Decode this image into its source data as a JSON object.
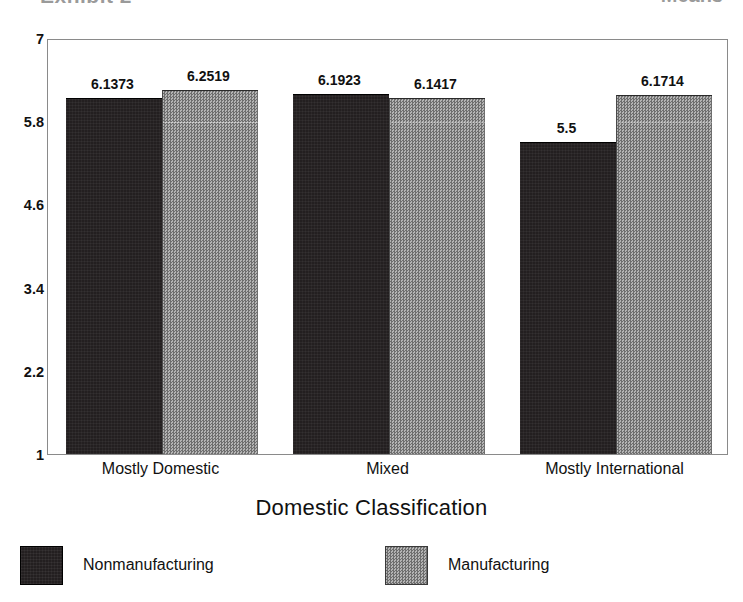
{
  "header": {
    "clipped_title_left": "Exhibit 2",
    "clipped_title_right": "Means"
  },
  "chart_data": {
    "type": "bar",
    "title": "",
    "xlabel": "Domestic Classification",
    "ylabel": "",
    "categories": [
      "Mostly Domestic",
      "Mixed",
      "Mostly International"
    ],
    "series": [
      {
        "name": "Nonmanufacturing",
        "color": "#231f20",
        "values": [
          6.1373,
          6.1923,
          5.5
        ],
        "labels": [
          "6.1373",
          "6.1923",
          "5.5"
        ]
      },
      {
        "name": "Manufacturing",
        "color": "#8d8d8d",
        "values": [
          6.2519,
          6.1417,
          6.1714
        ],
        "labels": [
          "6.2519",
          "6.1417",
          "6.1714"
        ]
      }
    ],
    "ylim": [
      1,
      7
    ],
    "yticks": [
      7,
      5.8,
      4.6,
      3.4,
      2.2,
      1
    ],
    "ytick_labels": [
      "7",
      "5.8",
      "4.6",
      "3.4",
      "2.2",
      "1"
    ],
    "grid": false,
    "legend_position": "bottom"
  },
  "axis": {
    "x_title": "Domestic Classification"
  },
  "legend": {
    "items": [
      {
        "label": "Nonmanufacturing",
        "swatch": "dark"
      },
      {
        "label": "Manufacturing",
        "swatch": "gray"
      }
    ]
  }
}
